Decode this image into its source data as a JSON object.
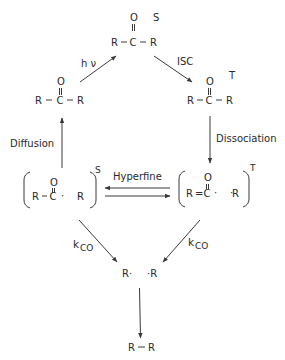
{
  "diagram": {
    "nodes": {
      "ground_ketone": {
        "O": "O",
        "dbl": "=",
        "R1": "R",
        "C": "C",
        "R2": "R",
        "bond": "–"
      },
      "singlet_ketone": {
        "O": "O",
        "R1": "R",
        "C": "C",
        "R2": "R",
        "state": "S"
      },
      "triplet_ketone": {
        "O": "O",
        "R1": "R",
        "C": "C",
        "R2": "R",
        "state": "T"
      },
      "singlet_radical_pair": {
        "O": "O",
        "R1": "R",
        "C": "C",
        "dots": "·    ·",
        "R2": "R",
        "state": "S"
      },
      "triplet_radical_pair": {
        "O": "O",
        "R1": "R",
        "eq": "=",
        "C": "C",
        "dots": "·    ·",
        "R2": "R",
        "state": "T"
      },
      "alkyl_radicals": {
        "left": "R·",
        "right": "·R"
      },
      "product": {
        "R1": "R",
        "bond": "—",
        "R2": "R"
      }
    },
    "edges": {
      "excitation": {
        "label": "h ν"
      },
      "isc": {
        "label": "ISC"
      },
      "dissociation": {
        "label": "Dissociation"
      },
      "diffusion": {
        "label": "Diffusion"
      },
      "hyperfine": {
        "label": "Hyperfine"
      },
      "kco_left": {
        "label_main": "k",
        "label_sub": "CO"
      },
      "kco_right": {
        "label_main": "k",
        "label_sub": "CO"
      },
      "recombination": {
        "label": ""
      }
    },
    "colors": {
      "ink": "#2a2a2a",
      "background": "#ffffff"
    }
  }
}
